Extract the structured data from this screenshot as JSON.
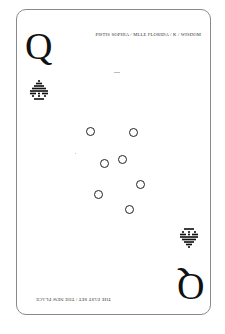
{
  "card": {
    "rank": "Q",
    "caption_top": "PISTIS SOPHIA / MLLE FLORIDA / K / WISDOM",
    "caption_bottom": "THE FAST SET / THE NEW PLACE",
    "suit_icon": "dotted-spade-icon",
    "border_color": "#8a8a8a",
    "ink_color": "#111111"
  },
  "rings": [
    {
      "x": 89,
      "y": 130
    },
    {
      "x": 132,
      "y": 131
    },
    {
      "x": 103,
      "y": 162
    },
    {
      "x": 121,
      "y": 158
    },
    {
      "x": 139,
      "y": 183
    },
    {
      "x": 97,
      "y": 193
    },
    {
      "x": 128,
      "y": 208
    }
  ]
}
